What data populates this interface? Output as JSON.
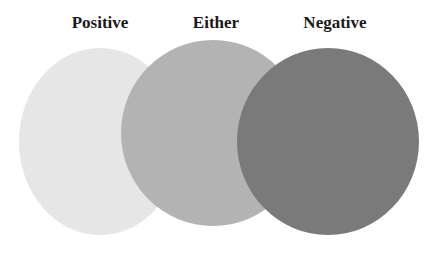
{
  "diagram": {
    "type": "overlapping-circles",
    "circles": [
      {
        "label": "Positive",
        "color": "#e6e6e6"
      },
      {
        "label": "Either",
        "color": "#b3b3b3"
      },
      {
        "label": "Negative",
        "color": "#7a7a7a"
      }
    ]
  }
}
